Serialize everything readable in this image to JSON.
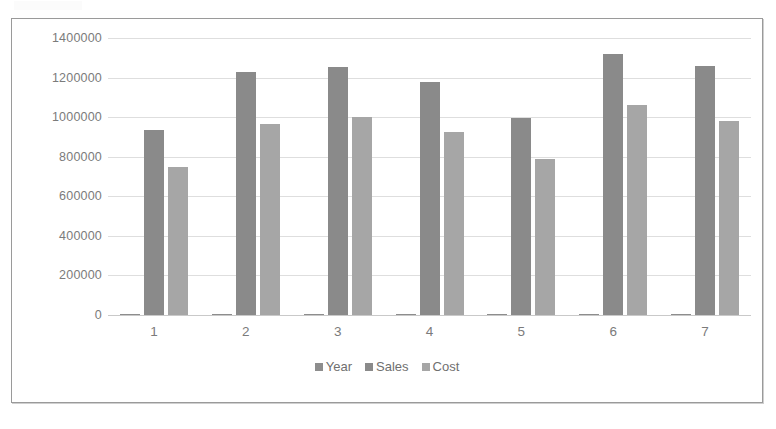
{
  "chart_data": {
    "type": "bar",
    "title": "",
    "subtitle": "",
    "xlabel": "",
    "ylabel": "",
    "categories": [
      "1",
      "2",
      "3",
      "4",
      "5",
      "6",
      "7"
    ],
    "series": [
      {
        "name": "Year",
        "color": "#8d8d8d",
        "values": [
          1,
          2,
          3,
          4,
          5,
          6,
          7
        ]
      },
      {
        "name": "Sales",
        "color": "#8a8a8a",
        "values": [
          936000,
          1230000,
          1255000,
          1178000,
          997000,
          1318000,
          1258000
        ]
      },
      {
        "name": "Cost",
        "color": "#a6a6a6",
        "values": [
          750000,
          967000,
          1003000,
          926000,
          790000,
          1063000,
          983000
        ]
      }
    ],
    "ylim": [
      0,
      1400000
    ],
    "y_ticks": [
      1400000,
      1200000,
      1000000,
      800000,
      600000,
      400000,
      200000,
      0
    ],
    "y_tick_labels": [
      "1400000",
      "1200000",
      "1000000",
      "800000",
      "600000",
      "400000",
      "200000",
      "0"
    ],
    "grid": true,
    "legend_position": "bottom",
    "legend_entries": [
      "Year",
      "Sales",
      "Cost"
    ],
    "annotations": []
  },
  "colors": {
    "frame_border": "#9a9a9a",
    "gridline": "#dedede",
    "axis_text": "#7b7b7b",
    "legend_text": "#6f6f6f",
    "background": "#ffffff"
  }
}
